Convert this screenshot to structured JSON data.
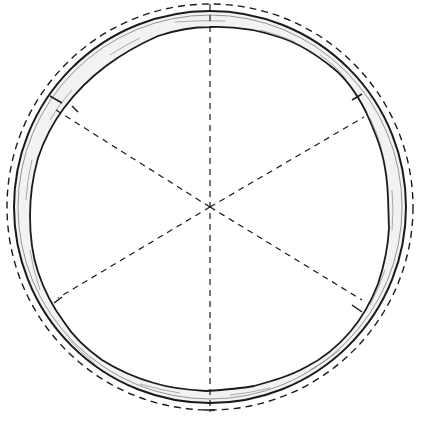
{
  "diagram": {
    "type": "cross-section ring sketch",
    "center": [
      210,
      207
    ],
    "outer_dashed_radius": 203,
    "outer_solid_radius": 196,
    "inner_wavy_radius": 182,
    "spoke_count": 6,
    "spoke_angles_deg": [
      90,
      30,
      -30,
      -90,
      -150,
      150
    ],
    "stroke_color": "#1a1a1a",
    "ring_fill": "#f4f4f4"
  }
}
